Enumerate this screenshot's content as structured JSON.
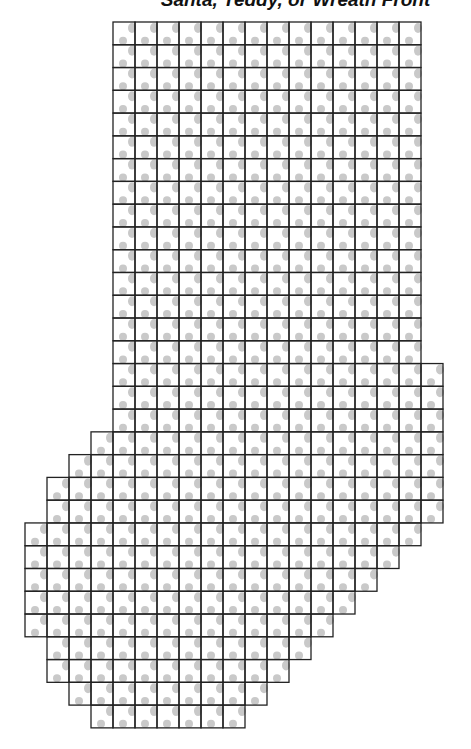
{
  "title": "Santa, Teddy, or Wreath Front",
  "pattern": {
    "origin_x": 25,
    "origin_y": 22,
    "cell_w": 22,
    "cell_h": 22.77,
    "line_color": "#222222",
    "dot_color": "#c9c9c9",
    "rows": [
      [
        4,
        17
      ],
      [
        4,
        17
      ],
      [
        4,
        17
      ],
      [
        4,
        17
      ],
      [
        4,
        17
      ],
      [
        4,
        17
      ],
      [
        4,
        17
      ],
      [
        4,
        17
      ],
      [
        4,
        17
      ],
      [
        4,
        17
      ],
      [
        4,
        17
      ],
      [
        4,
        17
      ],
      [
        4,
        17
      ],
      [
        4,
        17
      ],
      [
        4,
        17
      ],
      [
        4,
        18
      ],
      [
        4,
        18
      ],
      [
        4,
        18
      ],
      [
        3,
        18
      ],
      [
        2,
        18
      ],
      [
        1,
        18
      ],
      [
        1,
        18
      ],
      [
        0,
        17
      ],
      [
        0,
        16
      ],
      [
        0,
        15
      ],
      [
        0,
        14
      ],
      [
        0,
        13
      ],
      [
        1,
        12
      ],
      [
        1,
        11
      ],
      [
        2,
        10
      ],
      [
        3,
        9
      ]
    ]
  }
}
